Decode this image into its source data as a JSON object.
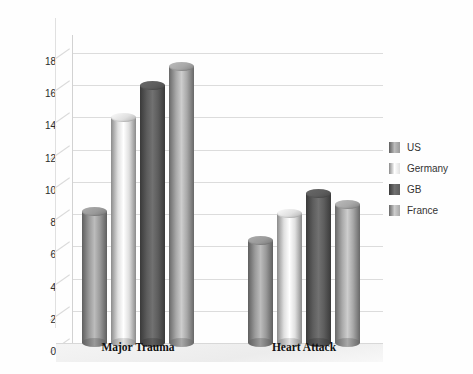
{
  "chart_data": {
    "type": "bar",
    "title": "",
    "subtitle": "",
    "xlabel": "",
    "ylabel": "",
    "categories": [
      "Major Trauma",
      "Heart Attack"
    ],
    "series": [
      {
        "name": "US",
        "color": "#9a9a9a",
        "values": [
          8.2,
          6.4
        ]
      },
      {
        "name": "Germany",
        "color": "#e0e0e0",
        "values": [
          14.0,
          8.1
        ]
      },
      {
        "name": "GB",
        "color": "#5d5d5d",
        "values": [
          16.0,
          9.3
        ]
      },
      {
        "name": "France",
        "color": "#a8a8a8",
        "values": [
          17.2,
          8.6
        ]
      }
    ],
    "yticks": [
      0,
      2,
      4,
      6,
      8,
      10,
      12,
      14,
      16,
      18
    ],
    "ylim": [
      0,
      19
    ],
    "grid": true,
    "legend_position": "right",
    "style": "3d-cylinder",
    "background": "#ffffff",
    "gridline_color": "#dcdcdc"
  },
  "legend": {
    "items": [
      {
        "label": "US",
        "color": "#9a9a9a"
      },
      {
        "label": "Germany",
        "color": "#e0e0e0"
      },
      {
        "label": "GB",
        "color": "#5d5d5d"
      },
      {
        "label": "France",
        "color": "#a8a8a8"
      }
    ]
  }
}
